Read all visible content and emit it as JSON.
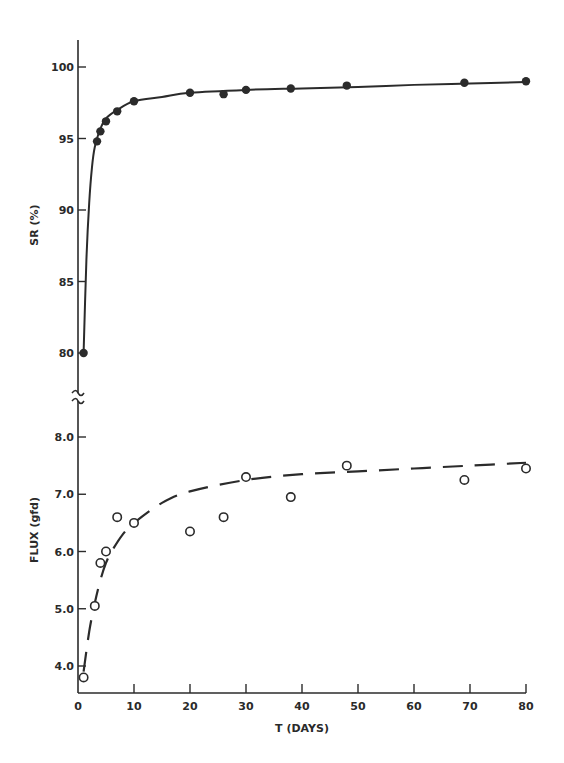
{
  "chart_data": [
    {
      "type": "scatter",
      "panel": "top",
      "title": "",
      "xlabel": "T (DAYS)",
      "ylabel": "SR (%)",
      "xlim": [
        0,
        80
      ],
      "ylim": [
        78,
        102
      ],
      "yticks": [
        80,
        85,
        90,
        95,
        100
      ],
      "ytick_labels": [
        "80",
        "85",
        "90",
        "95",
        "100"
      ],
      "axis_break": true,
      "grid": false,
      "legend": null,
      "series": [
        {
          "name": "SR measured",
          "marker": "filled-circle",
          "x": [
            1,
            3.4,
            4,
            5,
            7,
            10,
            20,
            26,
            30,
            38,
            48,
            69,
            80
          ],
          "y": [
            80.0,
            94.8,
            95.5,
            96.2,
            96.9,
            97.6,
            98.2,
            98.1,
            98.4,
            98.5,
            98.7,
            98.9,
            99.0
          ]
        },
        {
          "name": "SR fit",
          "line": "solid",
          "x": [
            1,
            1.5,
            2,
            2.5,
            3,
            4,
            5,
            7,
            10,
            15,
            20,
            30,
            40,
            50,
            60,
            70,
            80
          ],
          "y": [
            80.0,
            86.5,
            90.5,
            93.0,
            94.4,
            95.7,
            96.4,
            97.0,
            97.6,
            97.9,
            98.2,
            98.4,
            98.5,
            98.6,
            98.75,
            98.85,
            98.95
          ]
        }
      ]
    },
    {
      "type": "scatter",
      "panel": "bottom",
      "title": "",
      "xlabel": "T (DAYS)",
      "ylabel": "FLUX (gfd)",
      "xlim": [
        0,
        80
      ],
      "ylim": [
        3.5,
        8.5
      ],
      "xticks": [
        0,
        10,
        20,
        30,
        40,
        50,
        60,
        70,
        80
      ],
      "xtick_labels": [
        "0",
        "10",
        "20",
        "30",
        "40",
        "50",
        "60",
        "70",
        "80"
      ],
      "yticks": [
        4.0,
        5.0,
        6.0,
        7.0,
        8.0
      ],
      "ytick_labels": [
        "4.0",
        "5.0",
        "6.0",
        "7.0",
        "8.0"
      ],
      "grid": false,
      "legend": null,
      "series": [
        {
          "name": "Flux measured",
          "marker": "open-circle",
          "x": [
            1,
            3,
            4,
            5,
            7,
            10,
            20,
            26,
            30,
            38,
            48,
            69,
            80
          ],
          "y": [
            3.8,
            5.05,
            5.8,
            6.0,
            6.6,
            6.5,
            6.35,
            6.6,
            7.3,
            6.95,
            7.5,
            7.25,
            7.45
          ]
        },
        {
          "name": "Flux fit",
          "line": "dashed",
          "x": [
            1,
            2,
            3,
            4,
            5,
            6,
            8,
            10,
            15,
            20,
            30,
            40,
            50,
            60,
            70,
            80
          ],
          "y": [
            3.9,
            4.6,
            5.1,
            5.5,
            5.8,
            6.0,
            6.3,
            6.5,
            6.85,
            7.05,
            7.25,
            7.35,
            7.4,
            7.45,
            7.5,
            7.55
          ]
        }
      ]
    }
  ],
  "labels": {
    "top_ylabel": "SR (%)",
    "bottom_ylabel": "FLUX (gfd)",
    "xlabel": "T (DAYS)"
  }
}
